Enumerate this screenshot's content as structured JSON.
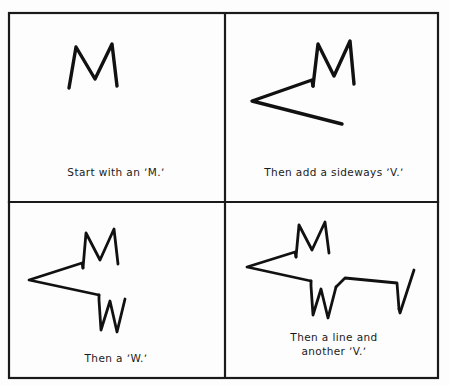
{
  "sheet": {
    "title": "How to draw a fox",
    "background_color": "#fdfdfd",
    "ink_color": "#111111",
    "frame_color": "#1a1a1a",
    "width": 449,
    "height": 385
  },
  "frame": {
    "outer": {
      "x": 9,
      "y": 13,
      "width": 429,
      "height": 365
    },
    "vertical_divider_x": 225,
    "horizontal_divider_y": 202
  },
  "panels": [
    {
      "index": 1,
      "caption": "Start with an ʼM.ʼ",
      "shape_name": "letter-m",
      "description": "Letter M forming the fox ears",
      "strokes": [
        "M 69 88 L 76 47 L 95 79 L 112 44 L 117 86"
      ]
    },
    {
      "index": 2,
      "caption": "Then add a sideways ʼV.ʼ",
      "shape_name": "letter-m-plus-sideways-v",
      "description": "Letter M with a sideways V added for the snout",
      "strokes": [
        "M 313 86 L 318 44 L 334 76 L 350 41 L 354 84",
        "M 313 86 L 312 80 L 252 101 L 342 124"
      ]
    },
    {
      "index": 3,
      "caption": "Then a ʼW.ʼ",
      "shape_name": "letter-m-v-w",
      "description": "M ears, sideways V head and a W for the legs",
      "strokes": [
        "M 83 268 L 86 233 L 100 260 L 114 229 L 118 264",
        "M 83 268 L 82 263 L 29 280 L 99 295",
        "M 99 295 L 99 300 L 101 330 L 110 301 L 117 332 L 125 299"
      ]
    },
    {
      "index": 4,
      "caption": "Then a line and\nanother ʼV.ʼ",
      "shape_name": "complete-fox",
      "description": "Full fox outline: M ears, sideways V head, W legs, a back line and a V tail",
      "strokes": [
        "M 296 257 L 299 225 L 312 250 L 325 222 L 329 253",
        "M 296 257 L 295 252 L 247 267 L 311 281",
        "M 311 281 L 311 286 L 313 315 L 321 289 L 328 318 L 336 287",
        "M 336 287 L 345 278 L 397 283 L 399 309",
        "M 399 309 L 400 313 L 414 270"
      ]
    }
  ]
}
